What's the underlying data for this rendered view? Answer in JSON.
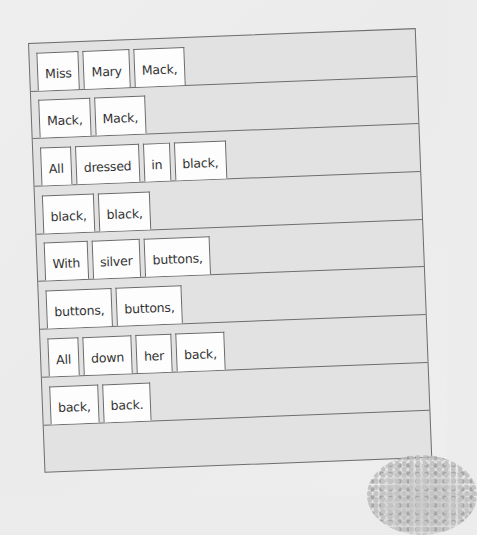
{
  "document": {
    "type": "word-card sentence strip worksheet",
    "rows": [
      {
        "words": [
          "Miss",
          "Mary",
          "Mack,"
        ]
      },
      {
        "words": [
          "Mack,",
          "Mack,"
        ]
      },
      {
        "words": [
          "All",
          "dressed",
          "in",
          "black,"
        ]
      },
      {
        "words": [
          "black,",
          "black,"
        ]
      },
      {
        "words": [
          "With",
          "silver",
          "buttons,"
        ]
      },
      {
        "words": [
          "buttons,",
          "buttons,"
        ]
      },
      {
        "words": [
          "All",
          "down",
          "her",
          "back,"
        ]
      },
      {
        "words": [
          "back,",
          "back."
        ]
      },
      {
        "words": []
      }
    ]
  },
  "colors": {
    "background": "#ececec",
    "strip_fill": "#e2e2e2",
    "card_fill": "#fdfdfd",
    "border": "#6e6e6e",
    "text": "#333333"
  }
}
